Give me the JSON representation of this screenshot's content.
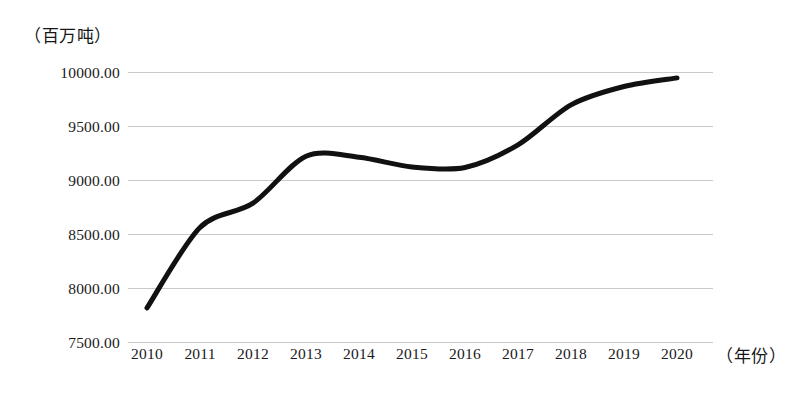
{
  "chart_data": {
    "type": "line",
    "title": "",
    "subtitle": "",
    "xlabel": "（年份）",
    "ylabel": "（百万吨）",
    "categories": [
      "2010",
      "2011",
      "2012",
      "2013",
      "2014",
      "2015",
      "2016",
      "2017",
      "2018",
      "2019",
      "2020"
    ],
    "values": [
      7820,
      8565,
      8790,
      9225,
      9215,
      9125,
      9120,
      9330,
      9700,
      9870,
      9950
    ],
    "series": [
      {
        "name": "",
        "values": [
          7820,
          8565,
          8790,
          9225,
          9215,
          9125,
          9120,
          9330,
          9700,
          9870,
          9950
        ]
      }
    ],
    "ylim": [
      7500,
      10000
    ],
    "ytick_values": [
      10000,
      9500,
      9000,
      8500,
      8000,
      7500
    ],
    "ytick_labels": [
      "10000.00",
      "9500.00",
      "9000.00",
      "8500.00",
      "8000.00",
      "7500.00"
    ],
    "xtick_labels": [
      "2010",
      "2011",
      "2012",
      "2013",
      "2014",
      "2015",
      "2016",
      "2017",
      "2018",
      "2019",
      "2020"
    ],
    "grid": "horizontal",
    "legend": "none",
    "line_color": "#111111",
    "grid_color": "#c9c9c9",
    "background_color": "#ffffff"
  },
  "axes": {
    "y_unit_label": "（百万吨）",
    "x_axis_title": "（年份）"
  }
}
